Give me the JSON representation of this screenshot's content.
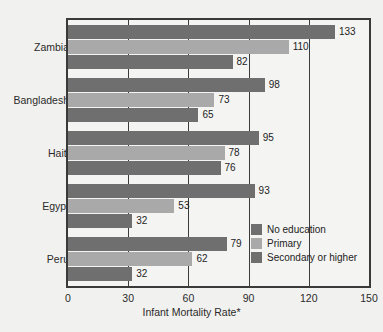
{
  "chart_data": {
    "type": "bar",
    "orientation": "horizontal",
    "title": "",
    "xlabel": "Infant Mortality Rate*",
    "ylabel": "",
    "xlim": [
      0,
      150
    ],
    "xticks": [
      0,
      30,
      60,
      90,
      120,
      150
    ],
    "grid": true,
    "legend_position": "inside-bottom-right",
    "categories": [
      "Zambia",
      "Bangladesh",
      "Haiti",
      "Egypt",
      "Peru"
    ],
    "series": [
      {
        "name": "No education",
        "color": "#6f6f6f",
        "values": [
          133,
          98,
          95,
          93,
          79
        ]
      },
      {
        "name": "Primary",
        "color": "#a9a9a9",
        "values": [
          110,
          73,
          78,
          53,
          62
        ]
      },
      {
        "name": "Secondary or higher",
        "color": "#6f6f6f",
        "values": [
          82,
          65,
          76,
          32,
          32
        ]
      }
    ]
  },
  "axis": {
    "x_title": "Infant Mortality Rate*",
    "tick_labels": [
      "0",
      "30",
      "60",
      "90",
      "120",
      "150"
    ]
  },
  "legend": {
    "items": [
      {
        "label": "No education"
      },
      {
        "label": "Primary"
      },
      {
        "label": "Secondary or higher"
      }
    ]
  },
  "footnote": {
    "text": ""
  }
}
